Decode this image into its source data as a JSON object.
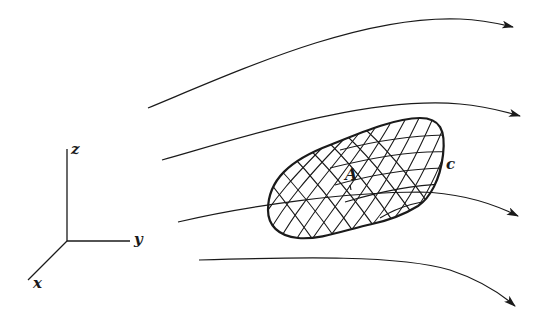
{
  "figure": {
    "background": "#ffffff",
    "ink_color": "#1a1a1a"
  },
  "axes": {
    "labels": {
      "z": "z",
      "y": "y",
      "x": "x"
    },
    "origin": [
      67,
      241
    ],
    "z_end": [
      67,
      149
    ],
    "y_end": [
      130,
      241
    ],
    "x_end": [
      28,
      280
    ]
  },
  "surface": {
    "point_label": "A",
    "boundary_label": "c",
    "style": "crosshatched mesh"
  },
  "flow_lines": [
    {
      "id": 1,
      "direction": "right",
      "path": "M148,108 C240,70 360,15 460,19 C485,20 500,24 513,27"
    },
    {
      "id": 2,
      "direction": "right",
      "path": "M162,160 C250,135 370,96 460,104 C485,106 503,111 520,116"
    },
    {
      "id": 3,
      "direction": "right",
      "path": "M178,222 C250,205 350,192 420,192 C460,193 492,203 518,216"
    },
    {
      "id": 4,
      "direction": "right",
      "path": "M199,260 C300,257 400,255 450,270 C480,280 500,293 515,306"
    }
  ]
}
